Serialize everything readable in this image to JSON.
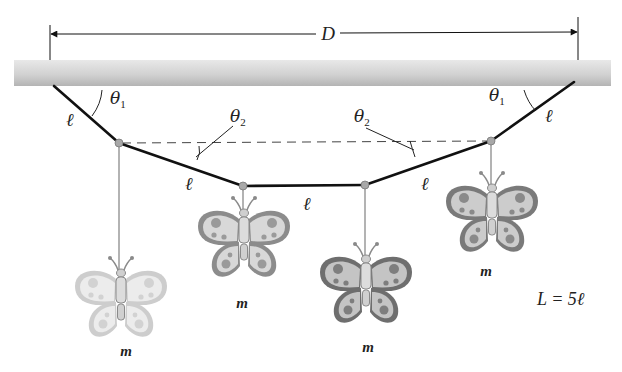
{
  "diagram": {
    "type": "physics-statics",
    "dimension": {
      "label": "D"
    },
    "segments": [
      {
        "label": "ℓ",
        "position": "left-outer"
      },
      {
        "label": "ℓ",
        "position": "left-inner"
      },
      {
        "label": "ℓ",
        "position": "middle"
      },
      {
        "label": "ℓ",
        "position": "right-inner"
      },
      {
        "label": "ℓ",
        "position": "right-outer"
      }
    ],
    "angles": [
      {
        "symbol": "θ",
        "sub": "1",
        "position": "left"
      },
      {
        "symbol": "θ",
        "sub": "2",
        "position": "left"
      },
      {
        "symbol": "θ",
        "sub": "2",
        "position": "right"
      },
      {
        "symbol": "θ",
        "sub": "1",
        "position": "right"
      }
    ],
    "masses": [
      {
        "label": "m",
        "index": 1
      },
      {
        "label": "m",
        "index": 2
      },
      {
        "label": "m",
        "index": 3
      },
      {
        "label": "m",
        "index": 4
      }
    ],
    "equation": "L = 5ℓ",
    "colors": {
      "string": "#111111",
      "ceiling_light": "#e2e2e2",
      "ceiling_dark": "#b8b8b8",
      "node": "#a8a8a8",
      "hanger": "#8a8a8a",
      "dashed": "#444444",
      "wing_outer": "#7d7d7d",
      "wing_fill": "#d6d6d6",
      "wing_pale": "#cfcfcf"
    }
  }
}
